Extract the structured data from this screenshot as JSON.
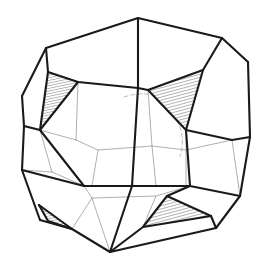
{
  "figure": {
    "title": "Polyhedron wireframe line drawing",
    "kind": "3d-polyhedron-line-drawing",
    "canvas": {
      "width": 266,
      "height": 266,
      "background": "#ffffff"
    },
    "style": {
      "visible_edge_color": "#1a1a1a",
      "visible_edge_width": 2.1,
      "hidden_edge_color": "#9a9a9a",
      "hidden_edge_width": 0.8,
      "dashed_edge_color": "#b0b0b0",
      "dashed_edge_width": 0.9,
      "dash_pattern": "4 3",
      "face_fill": "#ffffff",
      "hatch_line_color": "#4a4a4a",
      "hatch_line_width": 0.7,
      "hatch_spacing": 3,
      "hatch_angle_deg": 75
    },
    "vertices": {
      "top_apex": [
        138,
        18
      ],
      "top_left": [
        46,
        48
      ],
      "top_right": [
        222,
        38
      ],
      "upper_right_node": [
        248,
        62
      ],
      "left_upper": [
        22,
        96
      ],
      "right_node": [
        250,
        137
      ],
      "left_node": [
        22,
        170
      ],
      "bottom_left": [
        40,
        220
      ],
      "bottom_apex": [
        110,
        252
      ],
      "bottom_right": [
        216,
        228
      ],
      "bottom_far_right": [
        240,
        196
      ]
    },
    "hatched_faces": [
      {
        "name": "upper-left-hatched-triangle",
        "points": "48,72 78,82 40,130",
        "opacity": 1
      },
      {
        "name": "upper-right-hatched-triangle",
        "points": "148,90 203,70 186,130",
        "opacity": 1
      },
      {
        "name": "lower-right-hatched-triangle",
        "points": "167,196 211,216 143,227",
        "opacity": 1
      },
      {
        "name": "lower-left-hatched-sliver",
        "points": "39,205 72,229 48,221",
        "opacity": 1
      }
    ],
    "counts": {
      "hatched_faces": 4,
      "visible_vertices": 11
    }
  }
}
